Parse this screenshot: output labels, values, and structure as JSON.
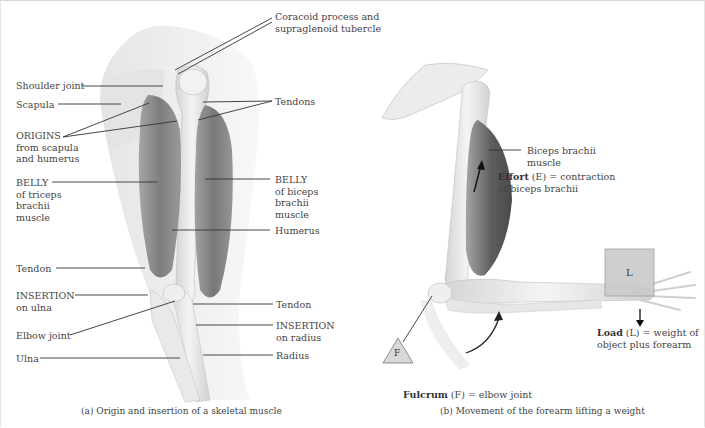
{
  "panel_a": {
    "caption": "(a) Origin and insertion of a skeletal muscle",
    "labels": {
      "coracoid_1": "Coracoid process and",
      "coracoid_2": "supraglenoid tubercle",
      "shoulder_joint": "Shoulder joint",
      "scapula": "Scapula",
      "origins_1": "ORIGINS",
      "origins_2": "from scapula",
      "origins_3": "and humerus",
      "tendons": "Tendons",
      "belly_triceps_1": "BELLY",
      "belly_triceps_2": "of triceps",
      "belly_triceps_3": "brachii",
      "belly_triceps_4": "muscle",
      "belly_biceps_1": "BELLY",
      "belly_biceps_2": "of biceps",
      "belly_biceps_3": "brachii",
      "belly_biceps_4": "muscle",
      "humerus": "Humerus",
      "tendon_left": "Tendon",
      "insertion_ulna_1": "INSERTION",
      "insertion_ulna_2": "on ulna",
      "elbow_joint": "Elbow joint",
      "ulna": "Ulna",
      "tendon_right": "Tendon",
      "insertion_radius_1": "INSERTION",
      "insertion_radius_2": "on radius",
      "radius": "Radius"
    }
  },
  "panel_b": {
    "caption": "(b) Movement of the forearm lifting a weight",
    "labels": {
      "biceps_1": "Biceps brachii",
      "biceps_2": "muscle",
      "effort_bold": "Effort",
      "effort_rest_1": " (E) = contraction",
      "effort_2": "of biceps brachii",
      "load_bold": "Load",
      "load_rest_1": " (L) = weight of",
      "load_2": "object plus forearm",
      "fulcrum_bold": "Fulcrum",
      "fulcrum_rest": " (F) = elbow joint",
      "load_box": "L",
      "fulcrum_triangle": "F"
    }
  },
  "colors": {
    "muscle_dark": "#6e6e6e",
    "bone_light": "#ececec",
    "leader_line": "#333333",
    "load_box": "#c9c9c9",
    "triangle": "#d6d6d6"
  }
}
